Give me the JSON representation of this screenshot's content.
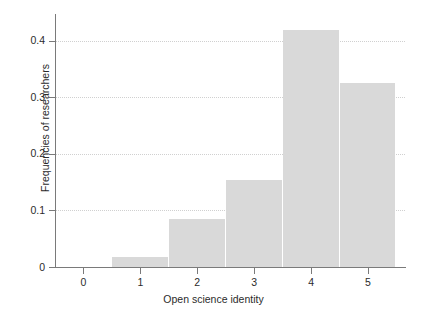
{
  "chart_data": {
    "type": "bar",
    "title": "",
    "subtitle": "",
    "xlabel": "Open science identity",
    "ylabel": "Frequencies of researchers",
    "categories": [
      "1",
      "2",
      "3",
      "4",
      "5"
    ],
    "values": [
      0.017,
      0.085,
      0.153,
      0.419,
      0.326
    ],
    "series": [
      {
        "name": "Frequencies of researchers",
        "values": [
          0.017,
          0.085,
          0.153,
          0.419,
          0.326
        ]
      }
    ],
    "xlim": [
      -0.5,
      5.65
    ],
    "ylim": [
      0,
      0.44
    ],
    "x_tick_labels": [
      "0",
      "1",
      "2",
      "3",
      "4",
      "5"
    ],
    "x_tick_values": [
      0,
      1,
      2,
      3,
      4,
      5
    ],
    "y_tick_labels": [
      "0",
      "0.1",
      "0.2",
      "0.3",
      "0.4"
    ],
    "y_tick_values": [
      0,
      0.1,
      0.2,
      0.3,
      0.4
    ],
    "grid": "horizontal-dotted",
    "legend": "none",
    "bar_width": 1,
    "bar_align": "center",
    "annotations": []
  },
  "style": {
    "bar_color": "#d9d9d9",
    "bar_edge_color": "#ffffff",
    "axis_color": "#7a7a7a",
    "grid_color": "#d0d0d0",
    "text_color": "#2b2b2b",
    "background": "#ffffff"
  }
}
